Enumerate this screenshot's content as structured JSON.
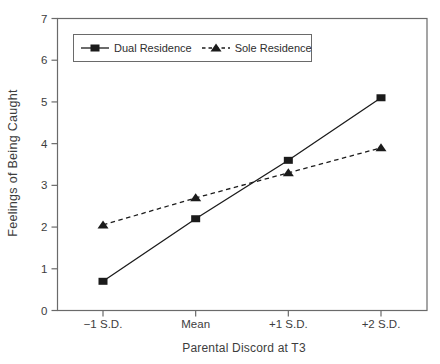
{
  "chart_data": {
    "type": "line",
    "title": "",
    "xlabel": "Parental Discord at T3",
    "ylabel": "Feelings of Being Caught",
    "categories": [
      "−1 S.D.",
      "Mean",
      "+1 S.D.",
      "+2 S.D."
    ],
    "series": [
      {
        "name": "Dual Residence",
        "marker": "square",
        "line_style": "solid",
        "values": [
          0.7,
          2.2,
          3.6,
          5.1
        ]
      },
      {
        "name": "Sole Residence",
        "marker": "triangle",
        "line_style": "dashed",
        "values": [
          2.05,
          2.7,
          3.3,
          3.9
        ]
      }
    ],
    "ylim": [
      0,
      7
    ],
    "y_ticks": [
      0,
      1,
      2,
      3,
      4,
      5,
      6,
      7
    ],
    "grid": false,
    "legend_position": "top-left-inside",
    "colors": {
      "series": "#1b1b1b",
      "frame": "#6a6a6a",
      "text": "#3d3d3d",
      "background": "#ffffff"
    }
  }
}
